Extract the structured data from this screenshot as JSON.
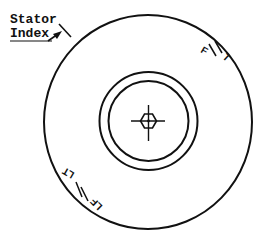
{
  "diagram": {
    "type": "stator dial face",
    "stroke_color": "#111111",
    "background": "#ffffff",
    "labels": {
      "stator_line1": "Stator",
      "stator_line2": "Index"
    },
    "marks": {
      "upper_right": {
        "left": "F",
        "right": "T"
      },
      "lower_left": {
        "left": "LF",
        "right": "LT"
      }
    },
    "geometry": {
      "center": [
        148,
        122
      ],
      "outer_radius": [
        104,
        107
      ],
      "ring_outer_radius": 49,
      "ring_inner_radius": 40,
      "hub_hexagon_radius": 8
    }
  }
}
